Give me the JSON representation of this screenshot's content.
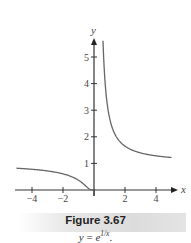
{
  "figure": {
    "label": "Figure 3.67",
    "equation_lhs": "y",
    "equation_eq": " = ",
    "equation_base": "e",
    "equation_exp": "1/x",
    "equation_end": "."
  },
  "chart_data": {
    "type": "line",
    "title": "",
    "function": "y = e^(1/x)",
    "xlabel": "x",
    "ylabel": "y",
    "xlim": [
      -5,
      5
    ],
    "ylim": [
      0,
      5.6
    ],
    "x_ticks": [
      -4,
      -2,
      2,
      4
    ],
    "x_tick_labels": [
      "−4",
      "−2",
      "2",
      "4"
    ],
    "y_ticks": [
      1,
      2,
      3,
      4,
      5
    ],
    "y_tick_labels": [
      "1",
      "2",
      "3",
      "4",
      "5"
    ],
    "grid": false,
    "series": [
      {
        "name": "left branch (x<0)",
        "x": [
          -5,
          -4,
          -3,
          -2,
          -1,
          -0.5,
          -0.25,
          0
        ],
        "y": [
          0.82,
          0.78,
          0.72,
          0.61,
          0.37,
          0.14,
          0.02,
          0
        ]
      },
      {
        "name": "right branch (x>0)",
        "x": [
          0.58,
          0.75,
          1,
          1.5,
          2,
          3,
          4,
          5
        ],
        "y": [
          5.6,
          3.79,
          2.72,
          1.95,
          1.65,
          1.4,
          1.28,
          1.22
        ]
      }
    ],
    "colors": {
      "axis": "#333333",
      "curve": "#666666"
    }
  }
}
